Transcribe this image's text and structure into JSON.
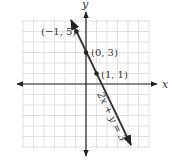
{
  "graph": {
    "equation_label": "2x + y = 3",
    "x_axis_label": "x",
    "y_axis_label": "y",
    "points": [
      {
        "label": "(−1, 5)",
        "x": -1,
        "y": 5
      },
      {
        "label": "(0, 3)",
        "x": 0,
        "y": 3
      },
      {
        "label": "(1, 1)",
        "x": 1,
        "y": 1
      }
    ],
    "grid": {
      "x_min": -6,
      "x_max": 6,
      "y_min": -6,
      "y_max": 6,
      "step": 1
    },
    "colors": {
      "grid": "#d9d9d9",
      "axis": "#222222",
      "line": "#333333",
      "point": "#222222",
      "text": "#333333"
    }
  },
  "chart_data": {
    "type": "line",
    "title": "",
    "xlabel": "x",
    "ylabel": "y",
    "series": [
      {
        "name": "2x + y = 3",
        "x": [
          -1,
          0,
          1
        ],
        "y": [
          5,
          3,
          1
        ]
      }
    ],
    "annotations": [
      "(−1, 5)",
      "(0, 3)",
      "(1, 1)",
      "2x + y = 3"
    ],
    "xlim": [
      -6,
      6
    ],
    "ylim": [
      -6,
      6
    ],
    "grid": true
  }
}
